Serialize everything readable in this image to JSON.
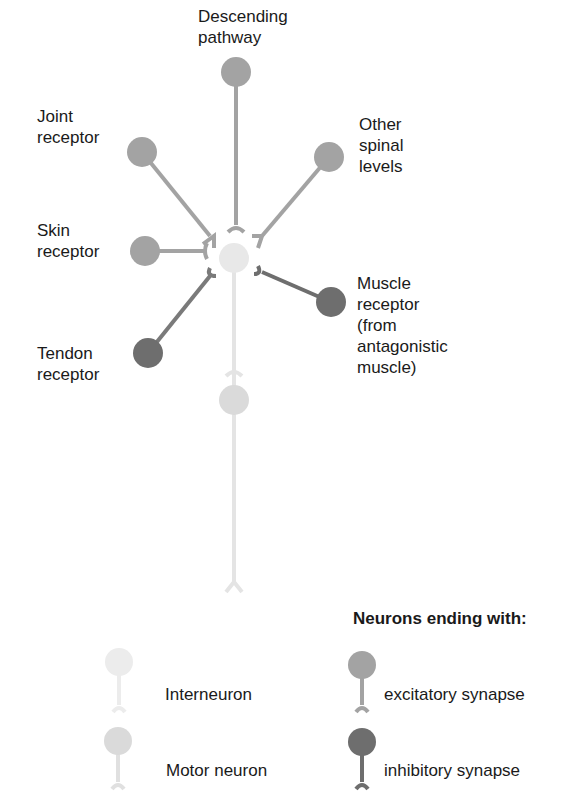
{
  "colors": {
    "excitatory": "#a3a3a3",
    "inhibitory": "#6e6e6e",
    "interneuron": "#e8e8e8",
    "motor": "#dadada"
  },
  "labels": {
    "descending": "Descending\npathway",
    "joint": "Joint\nreceptor",
    "other": "Other\nspinal\nlevels",
    "skin": "Skin\nreceptor",
    "muscle": "Muscle\nreceptor\n(from\nantagonistic\nmuscle)",
    "tendon": "Tendon\nreceptor"
  },
  "legend": {
    "title": "Neurons ending with:",
    "items": [
      {
        "label": "Interneuron"
      },
      {
        "label": "Motor neuron"
      },
      {
        "label": "excitatory synapse"
      },
      {
        "label": "inhibitory synapse"
      }
    ]
  }
}
